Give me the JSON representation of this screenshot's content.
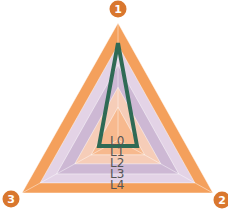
{
  "chart_data": {
    "type": "radar",
    "title": "",
    "axes": [
      {
        "id": "1",
        "label": "1"
      },
      {
        "id": "2",
        "label": "2"
      },
      {
        "id": "3",
        "label": "3"
      }
    ],
    "levels": [
      "L0",
      "L1",
      "L2",
      "L3",
      "L4"
    ],
    "level_scales": [
      0.28,
      0.45,
      0.64,
      0.81,
      1.0
    ],
    "level_colors": [
      "#F7B98E",
      "#F6CDB8",
      "#CDB8D4",
      "#E3D3E6",
      "#F4A05C"
    ],
    "series": [
      {
        "name": "profile",
        "values": {
          "1": 0.83,
          "2": 0.2,
          "3": 0.2
        },
        "color": "#2F6A55"
      }
    ],
    "geometry": {
      "center": [
        118,
        140
      ],
      "outer_vertices": [
        [
          118,
          23
        ],
        [
          213,
          193
        ],
        [
          22,
          193
        ]
      ],
      "series_vertices": [
        [
          118,
          43
        ],
        [
          137,
          146
        ],
        [
          99,
          146
        ]
      ]
    },
    "badge_color": "#D9772E",
    "badge_text_color": "#FFFFFF",
    "label_color": "#555555"
  }
}
